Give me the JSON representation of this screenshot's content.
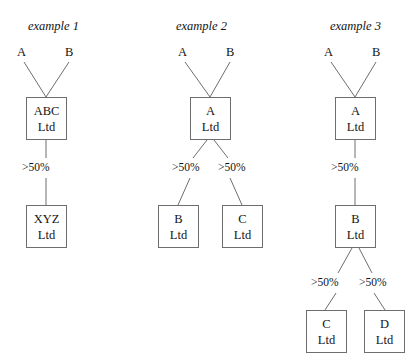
{
  "diagram": {
    "type": "corporate-ownership-tree",
    "background_color": "#ffffff",
    "line_color": "#6e6e6e",
    "text_color": "#141414",
    "examples": [
      {
        "id": "example-1",
        "title": "example 1",
        "title_pos": {
          "x": 28,
          "y": 20
        },
        "shareholders": [
          {
            "id": "sh-a",
            "label": "A",
            "x": 17,
            "y": 46
          },
          {
            "id": "sh-b",
            "label": "B",
            "x": 65,
            "y": 46
          }
        ],
        "boxes": [
          {
            "id": "box-abc-ltd",
            "line1": "ABC",
            "line2": "Ltd",
            "x": 26,
            "y": 97,
            "w": 41,
            "h": 43
          },
          {
            "id": "box-xyz-ltd",
            "line1": "XYZ",
            "line2": "Ltd",
            "x": 26,
            "y": 205,
            "w": 41,
            "h": 43
          }
        ],
        "percent_labels": [
          {
            "id": "pct-abc-xyz",
            "label": ">50%",
            "x": 22,
            "y": 162
          }
        ],
        "edges": [
          {
            "id": "edge-a-abc",
            "x1": 24,
            "y1": 62,
            "x2": 46,
            "y2": 97
          },
          {
            "id": "edge-b-abc",
            "x1": 69,
            "y1": 62,
            "x2": 46,
            "y2": 97
          },
          {
            "id": "edge-abc-pct",
            "x1": 46,
            "y1": 140,
            "x2": 46,
            "y2": 158
          },
          {
            "id": "edge-pct-xyz",
            "x1": 46,
            "y1": 178,
            "x2": 46,
            "y2": 205
          }
        ]
      },
      {
        "id": "example-2",
        "title": "example 2",
        "title_pos": {
          "x": 176,
          "y": 20
        },
        "shareholders": [
          {
            "id": "sh-a",
            "label": "A",
            "x": 178,
            "y": 46
          },
          {
            "id": "sh-b",
            "label": "B",
            "x": 226,
            "y": 46
          }
        ],
        "boxes": [
          {
            "id": "box-a-ltd",
            "line1": "A",
            "line2": "Ltd",
            "x": 190,
            "y": 97,
            "w": 41,
            "h": 43
          },
          {
            "id": "box-b-ltd",
            "line1": "B",
            "line2": "Ltd",
            "x": 158,
            "y": 205,
            "w": 41,
            "h": 43
          },
          {
            "id": "box-c-ltd",
            "line1": "C",
            "line2": "Ltd",
            "x": 222,
            "y": 205,
            "w": 41,
            "h": 43
          }
        ],
        "percent_labels": [
          {
            "id": "pct-a-b",
            "label": ">50%",
            "x": 172,
            "y": 162
          },
          {
            "id": "pct-a-c",
            "label": ">50%",
            "x": 218,
            "y": 162
          }
        ],
        "edges": [
          {
            "id": "edge-a-altd",
            "x1": 185,
            "y1": 62,
            "x2": 210,
            "y2": 97
          },
          {
            "id": "edge-b-altd",
            "x1": 230,
            "y1": 62,
            "x2": 210,
            "y2": 97
          },
          {
            "id": "edge-altd-pct1",
            "x1": 207,
            "y1": 140,
            "x2": 193,
            "y2": 158
          },
          {
            "id": "edge-altd-pct2",
            "x1": 214,
            "y1": 140,
            "x2": 228,
            "y2": 158
          },
          {
            "id": "edge-pct1-bltd",
            "x1": 190,
            "y1": 178,
            "x2": 178,
            "y2": 205
          },
          {
            "id": "edge-pct2-cltd",
            "x1": 230,
            "y1": 178,
            "x2": 242,
            "y2": 205
          }
        ]
      },
      {
        "id": "example-3",
        "title": "example 3",
        "title_pos": {
          "x": 330,
          "y": 20
        },
        "shareholders": [
          {
            "id": "sh-a",
            "label": "A",
            "x": 324,
            "y": 46
          },
          {
            "id": "sh-b",
            "label": "B",
            "x": 372,
            "y": 46
          }
        ],
        "boxes": [
          {
            "id": "box-a-ltd",
            "line1": "A",
            "line2": "Ltd",
            "x": 335,
            "y": 97,
            "w": 41,
            "h": 43
          },
          {
            "id": "box-b-ltd",
            "line1": "B",
            "line2": "Ltd",
            "x": 335,
            "y": 205,
            "w": 41,
            "h": 43
          },
          {
            "id": "box-c-ltd",
            "line1": "C",
            "line2": "Ltd",
            "x": 306,
            "y": 310,
            "w": 41,
            "h": 43
          },
          {
            "id": "box-d-ltd",
            "line1": "D",
            "line2": "Ltd",
            "x": 364,
            "y": 310,
            "w": 41,
            "h": 43
          }
        ],
        "percent_labels": [
          {
            "id": "pct-a-b",
            "label": ">50%",
            "x": 331,
            "y": 162
          },
          {
            "id": "pct-b-c",
            "label": ">50%",
            "x": 311,
            "y": 277
          },
          {
            "id": "pct-b-d",
            "label": ">50%",
            "x": 359,
            "y": 277
          }
        ],
        "edges": [
          {
            "id": "edge-a-altd",
            "x1": 331,
            "y1": 62,
            "x2": 355,
            "y2": 97
          },
          {
            "id": "edge-b-altd",
            "x1": 376,
            "y1": 62,
            "x2": 355,
            "y2": 97
          },
          {
            "id": "edge-altd-pct",
            "x1": 355,
            "y1": 140,
            "x2": 355,
            "y2": 158
          },
          {
            "id": "edge-pct-bltd",
            "x1": 355,
            "y1": 178,
            "x2": 355,
            "y2": 205
          },
          {
            "id": "edge-bltd-pct1",
            "x1": 352,
            "y1": 248,
            "x2": 338,
            "y2": 273
          },
          {
            "id": "edge-bltd-pct2",
            "x1": 359,
            "y1": 248,
            "x2": 372,
            "y2": 273
          },
          {
            "id": "edge-pct1-cltd",
            "x1": 336,
            "y1": 293,
            "x2": 325,
            "y2": 310
          },
          {
            "id": "edge-pct2-dltd",
            "x1": 374,
            "y1": 293,
            "x2": 385,
            "y2": 310
          }
        ]
      }
    ]
  }
}
